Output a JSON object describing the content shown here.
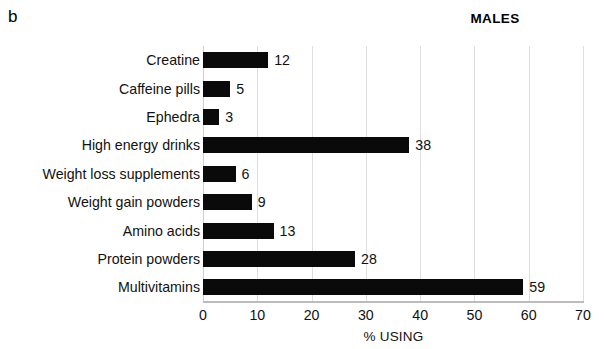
{
  "panel_label": "b",
  "title": "MALES",
  "chart_data": {
    "type": "bar",
    "orientation": "horizontal",
    "title": "MALES",
    "panel": "b",
    "xlabel": "% USING",
    "ylabel": "",
    "xlim": [
      0,
      70
    ],
    "xticks": [
      0,
      10,
      20,
      30,
      40,
      50,
      60,
      70
    ],
    "xtick_labels": [
      "0",
      "10",
      "20",
      "30",
      "40",
      "50",
      "60",
      "70"
    ],
    "grid": "vertical-light",
    "legend": "none",
    "bar_color": "#0a0a0a",
    "show_data_labels": true,
    "categories": [
      "Creatine",
      "Caffeine pills",
      "Ephedra",
      "High energy drinks",
      "Weight loss supplements",
      "Weight gain powders",
      "Amino acids",
      "Protein powders",
      "Multivitamins"
    ],
    "values": [
      12,
      5,
      3,
      38,
      6,
      9,
      13,
      28,
      59
    ],
    "value_labels": [
      "12",
      "5",
      "3",
      "38",
      "6",
      "9",
      "13",
      "28",
      "59"
    ]
  }
}
